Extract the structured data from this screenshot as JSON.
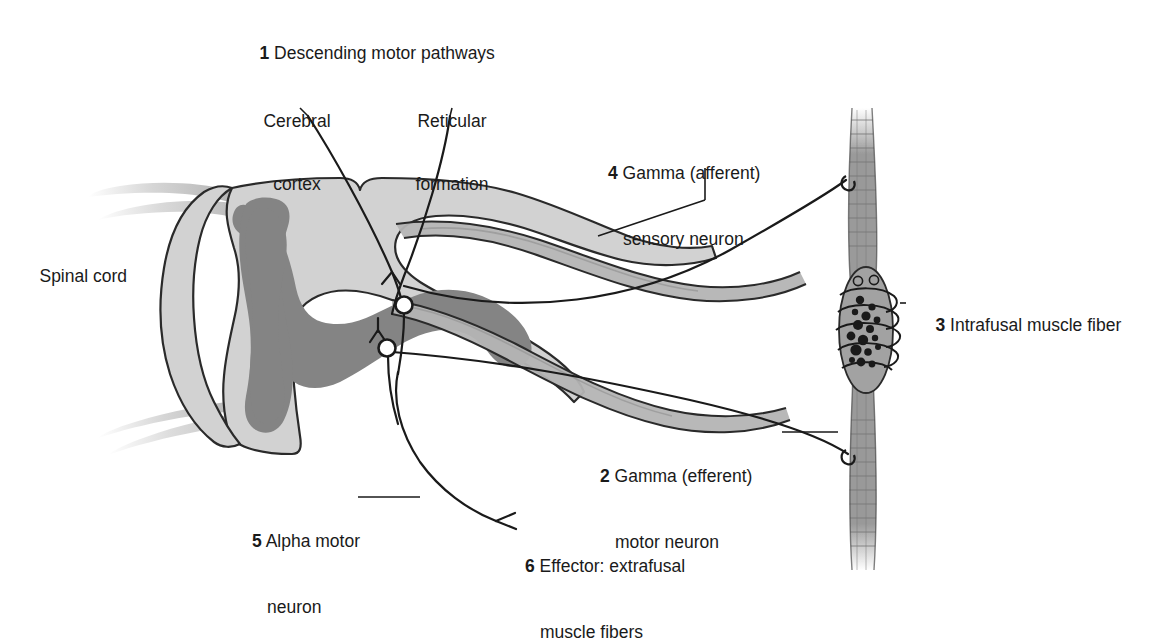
{
  "figure": {
    "title_text": "Muscle spindle gamma loop reflex diagram",
    "background": "#ffffff",
    "ink": "#1a1a1a",
    "white_matter_color": "#d2d2d2",
    "gray_matter_color": "#848484",
    "nerve_root_color": "#b4b4b4",
    "muscle_color": "#9a9a9a",
    "ellipse_fill": "#cfcfcf"
  },
  "labels": {
    "spinal_cord": "Spinal cord",
    "item1": {
      "num": "1",
      "text": "Descending motor pathways"
    },
    "item2": {
      "num": "2",
      "line1": "Gamma (efferent)",
      "line2": "motor neuron"
    },
    "item3": {
      "num": "3",
      "text": "Intrafusal muscle fiber"
    },
    "item4": {
      "num": "4",
      "line1": "Gamma (afferent)",
      "line2": "sensory neuron"
    },
    "item5": {
      "num": "5",
      "line1": "Alpha motor",
      "line2": "neuron"
    },
    "item6": {
      "num": "6",
      "line1": "Effector: extrafusal",
      "line2": "muscle fibers"
    }
  },
  "ellipses": [
    {
      "id": "cerebral-cortex",
      "line1": "Cerebral",
      "line2": "cortex"
    },
    {
      "id": "reticular-formation",
      "line1": "Reticular",
      "line2": "formation"
    }
  ]
}
